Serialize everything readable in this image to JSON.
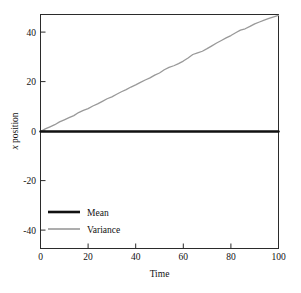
{
  "chart_data": {
    "type": "line",
    "title": "",
    "xlabel": "Time",
    "ylabel": "x position",
    "xlim": [
      0,
      100
    ],
    "ylim": [
      -50,
      50
    ],
    "xticks": [
      0,
      20,
      40,
      60,
      80,
      100
    ],
    "yticks": [
      40,
      20,
      0,
      -20,
      -40
    ],
    "xtick_labels": [
      "0",
      "20",
      "40",
      "60",
      "80",
      "100"
    ],
    "ytick_labels": [
      "40",
      "20",
      "0",
      "-20",
      "-40"
    ],
    "grid": false,
    "legend_position": "lower left",
    "series": [
      {
        "name": "Mean",
        "color": "#111111",
        "width": 2.4,
        "x": [
          0,
          5,
          10,
          15,
          20,
          25,
          30,
          35,
          40,
          45,
          50,
          55,
          60,
          65,
          70,
          75,
          80,
          85,
          90,
          95,
          100
        ],
        "values": [
          0,
          0,
          0,
          0,
          0,
          0,
          0,
          0,
          0,
          0,
          0,
          0,
          0,
          0,
          0,
          0,
          0,
          0,
          0,
          0,
          0
        ]
      },
      {
        "name": "Variance",
        "color": "#999999",
        "width": 1.3,
        "x": [
          0,
          2,
          4,
          6,
          8,
          10,
          12,
          14,
          16,
          18,
          20,
          22,
          24,
          26,
          28,
          30,
          32,
          34,
          36,
          38,
          40,
          42,
          44,
          46,
          48,
          50,
          52,
          54,
          56,
          58,
          60,
          62,
          64,
          66,
          68,
          70,
          72,
          74,
          76,
          78,
          80,
          82,
          84,
          86,
          88,
          90,
          92,
          94,
          96,
          98,
          100
        ],
        "values": [
          0.0,
          1.1,
          2.0,
          2.9,
          4.1,
          5.0,
          5.9,
          6.8,
          8.1,
          9.0,
          9.8,
          10.9,
          11.8,
          12.9,
          14.0,
          14.8,
          15.9,
          17.0,
          17.9,
          19.0,
          19.9,
          21.0,
          22.0,
          22.9,
          24.1,
          25.0,
          26.4,
          27.4,
          28.1,
          29.0,
          30.1,
          31.4,
          32.9,
          33.6,
          34.3,
          35.4,
          36.6,
          37.8,
          38.9,
          40.0,
          41.0,
          42.2,
          43.3,
          43.9,
          44.9,
          46.0,
          46.8,
          47.6,
          48.3,
          49.0,
          49.6
        ]
      }
    ]
  },
  "legend": {
    "entries": [
      {
        "label": "Mean",
        "color": "#111111"
      },
      {
        "label": "Variance",
        "color": "#999999"
      }
    ]
  },
  "axes": {
    "x_title": "Time",
    "y_title": "x position",
    "y_title_italic_prefix": "x",
    "y_title_rest": " position"
  },
  "colors": {
    "frame": "#2b2b2b",
    "text": "#111111",
    "mean": "#111111",
    "variance": "#999999",
    "background": "#ffffff"
  }
}
